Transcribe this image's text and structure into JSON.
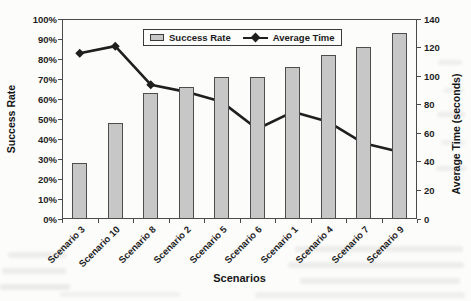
{
  "figure": {
    "kind": "scanned document chart figure",
    "background_color": "#fcfcfb"
  },
  "chart_data": {
    "type": "bar",
    "combo": "bar + line (dual axis)",
    "categories": [
      "Scenario 3",
      "Scenario 10",
      "Scenario 8",
      "Scenario 2",
      "Scenario 5",
      "Scenario 6",
      "Scenario 1",
      "Scenario 4",
      "Scenario 7",
      "Scenario 9"
    ],
    "series": [
      {
        "name": "Success Rate",
        "type": "bar",
        "axis": "left",
        "unit": "%",
        "values": [
          28,
          48,
          63,
          66,
          71,
          71,
          76,
          82,
          86,
          93
        ]
      },
      {
        "name": "Average Time",
        "type": "line",
        "axis": "right",
        "unit": "seconds",
        "values": [
          116,
          121,
          94,
          89,
          82,
          63,
          75,
          68,
          53,
          47
        ],
        "marker": "diamond"
      }
    ],
    "x_axis": {
      "title": "Scenarios"
    },
    "left_axis": {
      "title": "Success Rate",
      "min": 0,
      "max": 100,
      "step": 10,
      "format": "percent"
    },
    "right_axis": {
      "title": "Average Time (seconds)",
      "min": 0,
      "max": 140,
      "step": 20
    },
    "legend": {
      "position": "top-inside",
      "border": true,
      "entries": [
        "Success Rate",
        "Average Time"
      ]
    },
    "grid": "plot border only, no inner gridlines",
    "colors": {
      "bar_fill": "#c7c7c7",
      "bar_border": "#4d4d4d",
      "line": "#1f1f1f",
      "axis": "#4a4a4a",
      "text": "#1b1b1b"
    }
  }
}
